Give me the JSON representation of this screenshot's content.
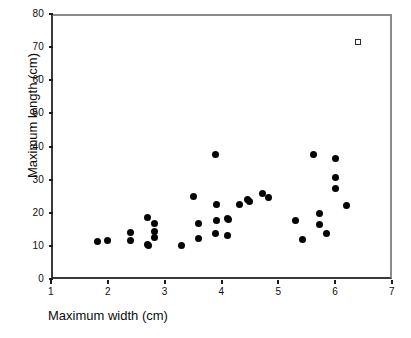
{
  "chart_data": {
    "type": "scatter",
    "title": "",
    "xlabel": "Maximum width (cm)",
    "ylabel": "Maximum length (cm)",
    "xlim": [
      1,
      7
    ],
    "ylim": [
      0,
      80
    ],
    "xticks": [
      "1",
      "2",
      "3",
      "4",
      "5",
      "6",
      "7"
    ],
    "yticks": [
      "0",
      "10",
      "20",
      "30",
      "40",
      "50",
      "60",
      "70",
      "80"
    ],
    "grid": false,
    "legend": null,
    "series": [
      {
        "name": "Specimens",
        "marker": "filled-circle",
        "color": "#050505",
        "points": [
          [
            1.82,
            11.3
          ],
          [
            2.0,
            11.5
          ],
          [
            2.4,
            14.0
          ],
          [
            2.4,
            11.5
          ],
          [
            2.7,
            18.5
          ],
          [
            2.7,
            10.5
          ],
          [
            2.72,
            10.0
          ],
          [
            2.82,
            16.8
          ],
          [
            2.82,
            14.3
          ],
          [
            2.82,
            12.6
          ],
          [
            3.3,
            10.2
          ],
          [
            3.5,
            24.8
          ],
          [
            3.6,
            16.7
          ],
          [
            3.6,
            12.3
          ],
          [
            3.9,
            37.5
          ],
          [
            3.92,
            22.4
          ],
          [
            3.92,
            17.6
          ],
          [
            3.9,
            13.8
          ],
          [
            4.1,
            18.4
          ],
          [
            4.12,
            17.9
          ],
          [
            4.1,
            13.1
          ],
          [
            4.32,
            22.4
          ],
          [
            4.45,
            24.0
          ],
          [
            4.5,
            23.4
          ],
          [
            4.72,
            25.7
          ],
          [
            4.82,
            24.6
          ],
          [
            5.3,
            17.7
          ],
          [
            5.42,
            11.9
          ],
          [
            5.62,
            37.6
          ],
          [
            5.72,
            19.9
          ],
          [
            5.72,
            16.4
          ],
          [
            5.85,
            13.7
          ],
          [
            6.0,
            36.3
          ],
          [
            6.0,
            30.7
          ],
          [
            6.0,
            27.3
          ],
          [
            6.2,
            22.2
          ]
        ]
      },
      {
        "name": "Outlier",
        "marker": "open-square",
        "color": "#2a2a2a",
        "points": [
          [
            6.4,
            71.5
          ]
        ]
      }
    ]
  }
}
